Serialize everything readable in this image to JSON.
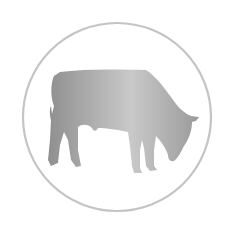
{
  "icon": {
    "name": "grazing-cow-icon",
    "description": "Gray gradient silhouette of a grazing cow inside a thin gray circle",
    "colors": {
      "background": "#ffffff",
      "circle_stroke": "#c4c4c4",
      "gradient_left": "#8f8f8f",
      "gradient_mid": "#c9c9c9",
      "gradient_right": "#9a9a9a"
    },
    "circle": {
      "cx": 117,
      "cy": 117,
      "r": 94,
      "stroke_width": 2.2
    }
  }
}
